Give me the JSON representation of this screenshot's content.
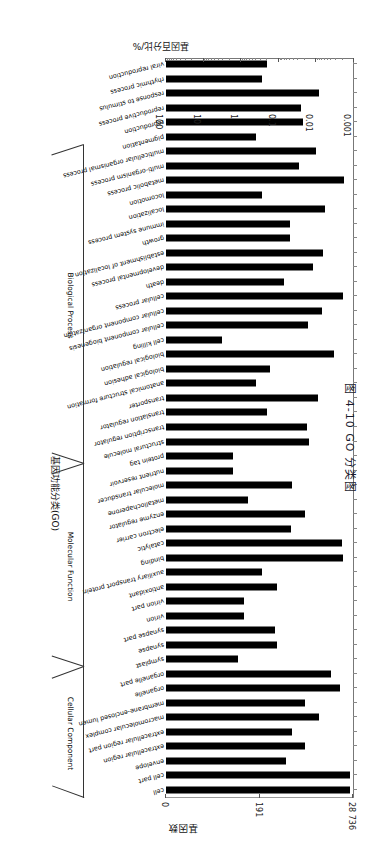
{
  "figure": {
    "caption": "图 4-10  GO 分类图",
    "x_axis_title": "基因数",
    "percent_axis_title": "基因百分比/%",
    "y_axis_title": "基因功能分类(GO)"
  },
  "axes": {
    "count_axis": {
      "labels": [
        "28 736",
        "191",
        "0"
      ],
      "max": 28736
    },
    "percent_axis": {
      "labels": [
        "100",
        "10",
        "1",
        "0.1",
        "0.01",
        "0.001"
      ],
      "values": [
        100,
        10,
        1,
        0.1,
        0.01,
        0.001
      ],
      "scale": "log"
    }
  },
  "groups": [
    {
      "name": "Cellular Component",
      "start": 0,
      "end": 8
    },
    {
      "name": "Molecular Function",
      "start": 9,
      "end": 22
    },
    {
      "name": "Biological Process",
      "start": 23,
      "end": 44
    }
  ],
  "chart_data": {
    "type": "bar",
    "title": "图 4-10  GO 分类图",
    "xlabel": "基因百分比/%",
    "ylabel": "基因功能分类(GO)",
    "secondary_xlabel": "基因数",
    "xscale": "log",
    "xlim": [
      0.001,
      100
    ],
    "grid": false,
    "legend": "none",
    "orientation": "horizontal",
    "categories": [
      "cell",
      "cell part",
      "envelope",
      "extracellular region",
      "extracellular region part",
      "macromolecular complex",
      "membrane-enclosed lumen",
      "organelle",
      "organelle part",
      "symplast",
      "synapse",
      "synapse part",
      "virion",
      "virion part",
      "antioxidant",
      "auxiliary transport protein",
      "binding",
      "catalytic",
      "electron carrier",
      "enzyme regulator",
      "metallochaperone",
      "molecular transducer",
      "nutrient reservoir",
      "protein tag",
      "structural molecule",
      "transcription regulator",
      "translation regulator",
      "transporter",
      "anatomical structure formation",
      "biological adhesion",
      "biological regulation",
      "cell killing",
      "cellular component biogenesis",
      "cellular component organization",
      "cellular process",
      "death",
      "developmental process",
      "establishment of localization",
      "growth",
      "immune system process",
      "localization",
      "locomotion",
      "metabolic process",
      "multi-organism process",
      "multicellular organismal process",
      "pigmentation",
      "reproduction",
      "reproductive process",
      "response to stimulus",
      "rhythmic process",
      "viral reproduction"
    ],
    "values": [
      78.0,
      78.0,
      1.6,
      5.0,
      2.2,
      12.0,
      5.0,
      43.0,
      24.0,
      0.08,
      0.9,
      0.8,
      0.12,
      0.12,
      0.9,
      0.35,
      50.0,
      48.0,
      2.1,
      5.0,
      0.15,
      2.2,
      0.06,
      0.06,
      6.5,
      5.5,
      0.5,
      11.0,
      0.25,
      0.6,
      30.0,
      0.03,
      6.0,
      14.0,
      50.0,
      1.4,
      8.0,
      15.0,
      2.0,
      2.0,
      17.0,
      0.35,
      55.0,
      3.5,
      10.0,
      0.25,
      4.5,
      4.0,
      12.0,
      0.35,
      0.5
    ]
  }
}
